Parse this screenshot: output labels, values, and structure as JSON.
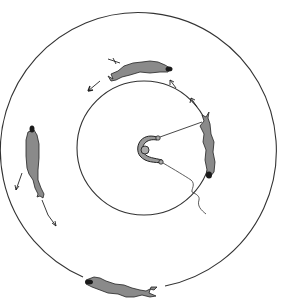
{
  "figure": {
    "description": "Circular arena diagram: tethered animal at several positions around an annular track between an outer and inner circle, with a central pivot/commutator connected by leads",
    "colors": {
      "background": "#ffffff",
      "stroke": "#333333",
      "animal_fill": "#8a8a8a",
      "animal_dark": "#1a1a1a"
    },
    "outer_circle": {
      "cx": 144,
      "cy": 150,
      "r": 138
    },
    "inner_circle": {
      "cx": 144,
      "cy": 148,
      "r": 67
    },
    "center_apparatus": {
      "cx": 148,
      "cy": 148
    },
    "animals": [
      {
        "position": "top",
        "label": "animal-top"
      },
      {
        "position": "right",
        "label": "animal-right-tethered"
      },
      {
        "position": "left",
        "label": "animal-left"
      },
      {
        "position": "bottom",
        "label": "animal-bottom"
      }
    ]
  }
}
